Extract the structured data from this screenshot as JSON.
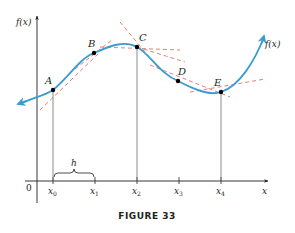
{
  "figure": {
    "caption": "FIGURE 33",
    "colors": {
      "curve": "#3a9bd1",
      "tangent": "#e0706a",
      "axis": "#231f20",
      "point": "#000000"
    },
    "axes": {
      "y_label": "f(x)",
      "x_label": "x",
      "origin_label": "0"
    },
    "curve_label": "f(x)",
    "points": [
      {
        "label": "A",
        "x_label": "x",
        "x_sub": "0"
      },
      {
        "label": "B",
        "x_label": "x",
        "x_sub": "1"
      },
      {
        "label": "C",
        "x_label": "x",
        "x_sub": "2"
      },
      {
        "label": "D",
        "x_label": "x",
        "x_sub": "3"
      },
      {
        "label": "E",
        "x_label": "x",
        "x_sub": "4"
      }
    ],
    "step_label": "h"
  }
}
